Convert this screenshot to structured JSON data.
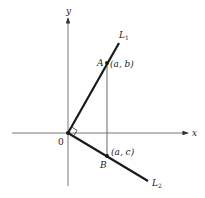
{
  "diagram": {
    "axes": {
      "x_label": "x",
      "y_label": "y",
      "origin_label": "0"
    },
    "lines": [
      {
        "name": "L",
        "subscript": "1"
      },
      {
        "name": "L",
        "subscript": "2"
      }
    ],
    "points": [
      {
        "name": "A",
        "coords": "(a, b)"
      },
      {
        "name": "B",
        "coords": "(a, c)"
      }
    ],
    "right_angle_marker": true,
    "colors": {
      "line": "#1a1a1a",
      "axis": "#555555",
      "background": "#ffffff"
    }
  }
}
